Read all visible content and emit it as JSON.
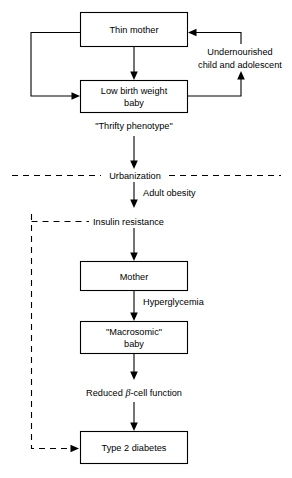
{
  "diagram": {
    "colors": {
      "background": "#ffffff",
      "stroke": "#000000",
      "text": "#000000"
    },
    "nodes": [
      {
        "id": "thin-mother",
        "label": "Thin mother",
        "x": 80,
        "y": 12,
        "w": 108,
        "h": 35
      },
      {
        "id": "low-birth-weight-baby",
        "label_line1": "Low birth weight",
        "label_line2": "baby",
        "x": 80,
        "y": 80,
        "w": 108,
        "h": 33
      },
      {
        "id": "mother",
        "label": "Mother",
        "x": 80,
        "y": 261,
        "w": 108,
        "h": 30
      },
      {
        "id": "macrosomic-baby",
        "label_line1": "\"Macrosomic\"",
        "label_line2": "baby",
        "x": 80,
        "y": 321,
        "w": 108,
        "h": 33
      },
      {
        "id": "type-2-diabetes",
        "label": "Type 2 diabetes",
        "x": 80,
        "y": 431,
        "w": 108,
        "h": 33
      }
    ],
    "edge_labels": [
      {
        "id": "undernourished",
        "line1": "Undernourished",
        "line2": "child and adolescent"
      },
      {
        "id": "thrifty-phenotype",
        "text": "\"Thrifty phenotype\""
      },
      {
        "id": "urbanization",
        "text": "Urbanization"
      },
      {
        "id": "adult-obesity",
        "text": "Adult obesity"
      },
      {
        "id": "insulin-resistance",
        "text": "Insulin resistance"
      },
      {
        "id": "hyperglycemia",
        "text": "Hyperglycemia"
      },
      {
        "id": "reduced-beta-cell-function",
        "prefix": "Reduced ",
        "symbol": "β",
        "suffix": "-cell function"
      }
    ]
  }
}
